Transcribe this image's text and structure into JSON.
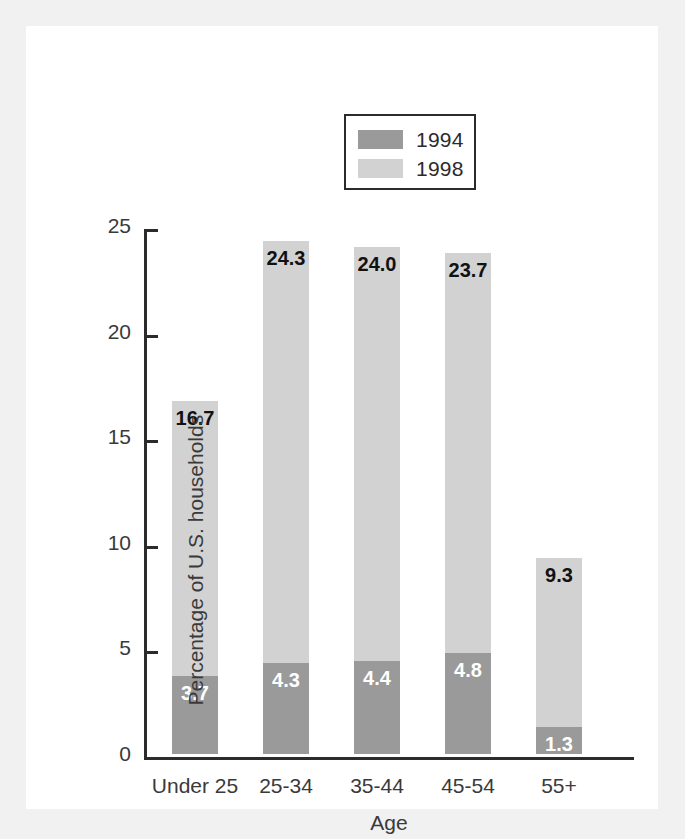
{
  "chart_data": {
    "type": "bar",
    "subtype": "stacked-bar",
    "title": "",
    "xlabel": "Age",
    "ylabel": "Percentage of U.S. households",
    "categories": [
      "Under 25",
      "25-34",
      "35-44",
      "45-54",
      "55+"
    ],
    "series": [
      {
        "name": "1994",
        "color": "#9a9a9a",
        "values": [
          3.7,
          4.3,
          4.4,
          4.8,
          1.3
        ],
        "value_labels": [
          "3.7",
          "4.3",
          "4.4",
          "4.8",
          "1.3"
        ],
        "label_color": "#ffffff"
      },
      {
        "name": "1998",
        "color": "#d2d2d2",
        "values": [
          16.7,
          24.3,
          24.0,
          23.7,
          9.3
        ],
        "value_labels": [
          "16.7",
          "24.3",
          "24.0",
          "23.7",
          "9.3"
        ],
        "label_color": "#111111",
        "note": "1998 values are cumulative totals shown at the top of each bar"
      }
    ],
    "ylim": [
      0,
      25
    ],
    "yticks": [
      0,
      5,
      10,
      15,
      20,
      25
    ],
    "ytick_labels": [
      "0",
      "5",
      "10",
      "15",
      "20",
      "25"
    ],
    "grid": false,
    "legend_position": "top-center",
    "legend_entries": [
      "1994",
      "1998"
    ]
  },
  "legend": {
    "items": [
      {
        "label": "1994",
        "color": "#9a9a9a"
      },
      {
        "label": "1998",
        "color": "#d2d2d2"
      }
    ]
  },
  "axes": {
    "y_title": "Percentage of U.S. households",
    "x_title": "Age",
    "y_ticks": [
      "25",
      "20",
      "15",
      "10",
      "5",
      "0"
    ],
    "x_ticks": [
      "Under 25",
      "25-34",
      "35-44",
      "45-54",
      "55+"
    ]
  },
  "bars": [
    {
      "category": "Under 25",
      "lower_label": "3.7",
      "upper_label": "16.7"
    },
    {
      "category": "25-34",
      "lower_label": "4.3",
      "upper_label": "24.3"
    },
    {
      "category": "35-44",
      "lower_label": "4.4",
      "upper_label": "24.0"
    },
    {
      "category": "45-54",
      "lower_label": "4.8",
      "upper_label": "23.7"
    },
    {
      "category": "55+",
      "lower_label": "1.3",
      "upper_label": "9.3"
    }
  ],
  "colors": {
    "series_1994": "#9a9a9a",
    "series_1998": "#d2d2d2",
    "axis": "#2b2b2b",
    "text": "#3a3a3a",
    "panel_background": "#ffffff",
    "page_background": "#f1f1f1"
  }
}
